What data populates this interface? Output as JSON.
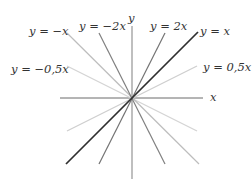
{
  "diagram": {
    "title": "",
    "axes": {
      "x_label": "x",
      "y_label": "y"
    },
    "lines": [
      {
        "id": "y_eq_x",
        "label": "y = x",
        "slope": 1,
        "color": "#333333",
        "width": 1.6
      },
      {
        "id": "y_eq_2x",
        "label": "y = 2x",
        "slope": 2,
        "color": "#777777",
        "width": 1.2
      },
      {
        "id": "y_eq_05x",
        "label": "y = 0,5x",
        "slope": 0.5,
        "color": "#cccccc",
        "width": 1.2
      },
      {
        "id": "y_eq_neg_x",
        "label": "y = −x",
        "slope": -1,
        "color": "#c8c8c8",
        "width": 1.2
      },
      {
        "id": "y_eq_neg_2x",
        "label": "y = −2x",
        "slope": -2,
        "color": "#888888",
        "width": 1.2
      },
      {
        "id": "y_eq_neg_05x",
        "label": "y = −0,5x",
        "slope": -0.5,
        "color": "#d4d4d4",
        "width": 1.2
      }
    ],
    "labels": {
      "neg_x": "y = −x",
      "neg_2x": "y = −2x",
      "y_axis": "y",
      "pos_2x": "y = 2x",
      "pos_x": "y = x",
      "neg_05x": "y = −0,5x",
      "pos_05x": "y = 0,5x",
      "x_axis": "x"
    }
  }
}
